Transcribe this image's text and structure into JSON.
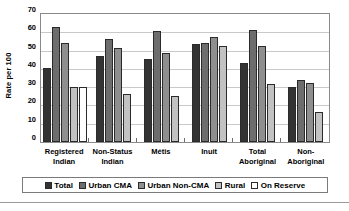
{
  "chart_data": {
    "type": "bar",
    "title": "",
    "xlabel": "",
    "ylabel": "Rate per 100",
    "ylim": [
      0,
      70
    ],
    "yticks": [
      0,
      10,
      20,
      30,
      40,
      50,
      60,
      70
    ],
    "grid": true,
    "legend_position": "bottom",
    "categories": [
      "Registered Indian",
      "Non-Status Indian",
      "Métis",
      "Inuit",
      "Total Aboriginal",
      "Non-Aboriginal"
    ],
    "category_lines": [
      [
        "Registered",
        "Indian"
      ],
      [
        "Non-Status",
        "Indian"
      ],
      [
        "Métis",
        ""
      ],
      [
        "Inuit",
        ""
      ],
      [
        "Total",
        "Aboriginal"
      ],
      [
        "Non-",
        "Aboriginal"
      ]
    ],
    "series": [
      {
        "name": "Total",
        "color": "#333333",
        "values": [
          40.5,
          47.2,
          45.2,
          53.6,
          43.1,
          29.9
        ]
      },
      {
        "name": "Urban CMA",
        "color": "#6d6d6d",
        "values": [
          63.0,
          56.5,
          60.5,
          54.1,
          61.1,
          34.0
        ]
      },
      {
        "name": "Urban Non-CMA",
        "color": "#8f8f8f",
        "values": [
          54.3,
          51.3,
          48.5,
          57.5,
          52.5,
          32.1
        ]
      },
      {
        "name": "Rural",
        "color": "#c2c2c2",
        "values": [
          30.0,
          26.1,
          24.9,
          52.6,
          31.9,
          16.5
        ]
      },
      {
        "name": "On Reserve",
        "color": "#ffffff",
        "values": [
          30.1,
          null,
          null,
          null,
          null,
          null
        ]
      }
    ]
  },
  "legend": {
    "items": [
      {
        "label": "Total",
        "swatch": "s0"
      },
      {
        "label": "Urban CMA",
        "swatch": "s1"
      },
      {
        "label": "Urban Non-CMA",
        "swatch": "s2"
      },
      {
        "label": "Rural",
        "swatch": "s3"
      },
      {
        "label": "On Reserve",
        "swatch": "s4"
      }
    ]
  }
}
